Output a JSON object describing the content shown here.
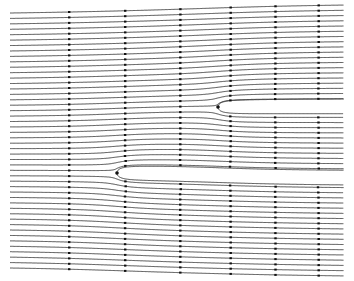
{
  "diagram": {
    "type": "streamline-plot",
    "canvas": {
      "width": 354,
      "height": 281,
      "background": "#ffffff"
    },
    "line_color": "#3a3a3a",
    "marker_color": "#111111",
    "x_range_px": [
      10,
      343
    ],
    "y_range_px": [
      13,
      268
    ],
    "streamline_count": 48,
    "uniform_flow_direction": "left-to-right",
    "sources": [
      {
        "name": "upper-source",
        "stagnation_point_px": [
          218,
          107
        ],
        "strength": 14
      },
      {
        "name": "lower-source",
        "stagnation_point_px": [
          117,
          173
        ],
        "strength": 14
      }
    ],
    "marker_columns_px": [
      69,
      125,
      180,
      230,
      275,
      318
    ]
  }
}
